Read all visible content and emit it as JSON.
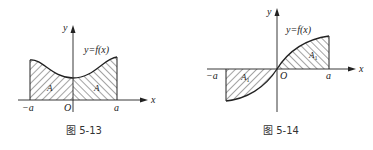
{
  "figures": [
    {
      "caption": "图 5-13",
      "function_label": "y=f(x)",
      "axis_x_label": "x",
      "axis_y_label": "y",
      "origin_label": "O",
      "left_bound_label": "−a",
      "right_bound_label": "a",
      "left_area_label": "A",
      "right_area_label": "A",
      "description": "Even function: symmetric shaded areas A on [-a,0] and [0,a]"
    },
    {
      "caption": "图 5-14",
      "function_label": "y=f(x)",
      "axis_x_label": "x",
      "axis_y_label": "y",
      "origin_label": "O",
      "left_bound_label": "−a",
      "right_bound_label": "a",
      "left_area_label": "A",
      "left_area_sub": "1",
      "right_area_label": "A",
      "right_area_sub": "1",
      "description": "Odd function: area A1 below axis on [-a,0] and A1 above axis on [0,a]"
    }
  ],
  "colors": {
    "ink": "#222222",
    "background": "#ffffff"
  }
}
